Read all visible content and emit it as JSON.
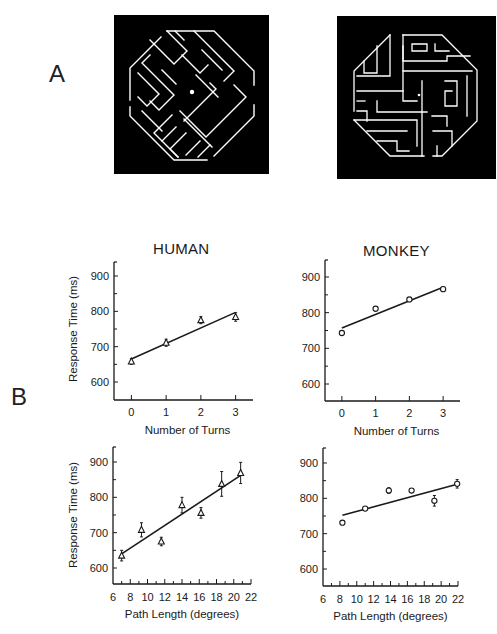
{
  "panels": {
    "a_label": "A",
    "b_label": "B"
  },
  "titles": {
    "human": "HUMAN",
    "monkey": "MONKEY"
  },
  "colors": {
    "maze_background": "#000000",
    "maze_lines": "#ffffff",
    "ink": "#1a1a1a"
  },
  "chart_data": [
    {
      "type": "scatter",
      "title": "HUMAN",
      "xlabel": "Number of Turns",
      "ylabel": "Response Time (ms)",
      "marker": "triangle",
      "x": [
        0,
        1,
        2,
        3
      ],
      "y": [
        658,
        711,
        775,
        784
      ],
      "error": [
        8,
        10,
        10,
        12
      ],
      "fit_line": {
        "x": [
          0,
          3
        ],
        "y": [
          665,
          797
        ]
      },
      "xticks": [
        0,
        1,
        2,
        3
      ],
      "yticks": [
        600,
        700,
        800,
        900
      ],
      "ylim": [
        550,
        950
      ],
      "xlim": [
        -0.5,
        3.5
      ]
    },
    {
      "type": "scatter",
      "title": "MONKEY",
      "xlabel": "Number of Turns",
      "ylabel": "",
      "marker": "circle",
      "x": [
        0,
        1,
        2,
        3
      ],
      "y": [
        743,
        811,
        837,
        866
      ],
      "error": [
        0,
        0,
        0,
        6
      ],
      "fit_line": {
        "x": [
          0,
          3
        ],
        "y": [
          757,
          871
        ]
      },
      "xticks": [
        0,
        1,
        2,
        3
      ],
      "yticks": [
        600,
        700,
        800,
        900
      ],
      "ylim": [
        550,
        950
      ],
      "xlim": [
        -0.5,
        3.5
      ]
    },
    {
      "type": "scatter",
      "title": "",
      "xlabel": "Path Length (degrees)",
      "ylabel": "Response Time (ms)",
      "marker": "triangle",
      "x": [
        7.0,
        9.3,
        11.6,
        14.0,
        16.2,
        18.6,
        20.8
      ],
      "y": [
        635,
        708,
        675,
        778,
        756,
        838,
        869
      ],
      "error": [
        15,
        20,
        12,
        22,
        15,
        35,
        30
      ],
      "fit_line": {
        "x": [
          7.0,
          20.8
        ],
        "y": [
          640,
          862
        ]
      },
      "xticks": [
        6,
        8,
        10,
        12,
        14,
        16,
        18,
        20,
        22
      ],
      "yticks": [
        600,
        700,
        800,
        900
      ],
      "ylim": [
        550,
        950
      ],
      "xlim": [
        6,
        22
      ]
    },
    {
      "type": "scatter",
      "title": "",
      "xlabel": "Path Length (degrees)",
      "ylabel": "",
      "marker": "circle",
      "x": [
        8.3,
        11.0,
        13.8,
        16.5,
        19.2,
        21.9
      ],
      "y": [
        731,
        771,
        822,
        822,
        793,
        841
      ],
      "error": [
        0,
        0,
        8,
        0,
        15,
        12
      ],
      "fit_line": {
        "x": [
          8.3,
          21.9
        ],
        "y": [
          752,
          840
        ]
      },
      "xticks": [
        6,
        8,
        10,
        12,
        14,
        16,
        18,
        20,
        22
      ],
      "yticks": [
        600,
        700,
        800,
        900
      ],
      "ylim": [
        550,
        950
      ],
      "xlim": [
        6,
        22
      ]
    }
  ]
}
